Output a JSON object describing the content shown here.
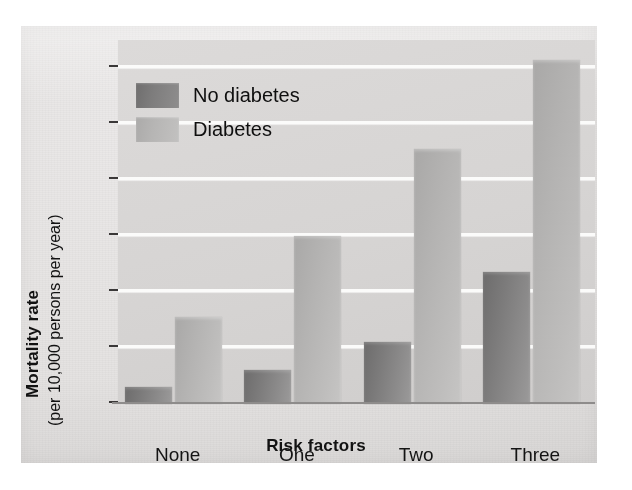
{
  "chart_data": {
    "type": "bar",
    "title": "",
    "xlabel": "Risk factors",
    "ylabel": "Mortality rate",
    "ylabel_sub": "(per 10,000 persons per year)",
    "categories": [
      "None",
      "One",
      "Two",
      "Three"
    ],
    "series": [
      {
        "name": "No diabetes",
        "color": "#7d7c7c",
        "values": [
          6,
          12,
          22,
          47
        ]
      },
      {
        "name": "Diabetes",
        "color": "#b8b7b6",
        "values": [
          31,
          60,
          91,
          123
        ]
      }
    ],
    "ylim": [
      0,
      130
    ],
    "yticks": [
      0,
      20,
      40,
      60,
      80,
      100,
      120
    ],
    "ytick_labels": [
      "0",
      "20",
      "40",
      "60",
      "80",
      "100",
      "120"
    ],
    "grid": "horizontal-white",
    "legend_position": "upper-left-inside"
  },
  "legend": {
    "items": [
      {
        "label": "No diabetes"
      },
      {
        "label": "Diabetes"
      }
    ]
  },
  "axes": {
    "y_title_main": "Mortality rate",
    "y_title_sub": "(per 10,000 persons per year)",
    "x_title": "Risk factors"
  }
}
